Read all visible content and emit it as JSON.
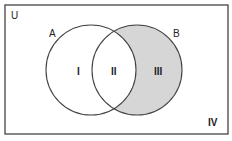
{
  "diagram": {
    "type": "venn",
    "universe_label": "U",
    "sets": [
      {
        "name": "A",
        "label": "A"
      },
      {
        "name": "B",
        "label": "B"
      }
    ],
    "regions": [
      {
        "id": "I",
        "label": "I",
        "description": "A only",
        "shaded": false
      },
      {
        "id": "II",
        "label": "II",
        "description": "A and B",
        "shaded": false
      },
      {
        "id": "III",
        "label": "III",
        "description": "B only",
        "shaded": true
      },
      {
        "id": "IV",
        "label": "IV",
        "description": "neither A nor B",
        "shaded": false
      }
    ],
    "colors": {
      "outline": "#444444",
      "shade": "#d6d6d6",
      "background": "#ffffff"
    }
  }
}
